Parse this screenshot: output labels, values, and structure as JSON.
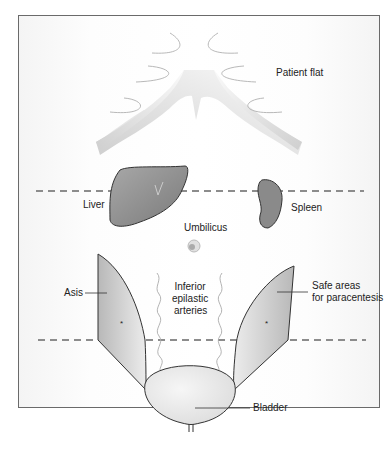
{
  "diagram": {
    "title_label": "Patient flat",
    "labels": {
      "liver": "Liver",
      "spleen": "Spleen",
      "umbilicus": "Umbilicus",
      "asis": "Asis",
      "inferior_line1": "Inferior",
      "inferior_line2": "epilastic",
      "inferior_line3": "arteries",
      "safe_line1": "Safe areas",
      "safe_line2": "for paracentesis",
      "bladder": "Bladder",
      "asterisk_left": "*",
      "asterisk_right": "*"
    },
    "colors": {
      "organ_fill": "#8a8a8a",
      "organ_stroke": "#333333",
      "dashed_line": "#8c8c8c",
      "rib_fill": "#d8d8d8",
      "frame": "#6a6a6a"
    }
  }
}
